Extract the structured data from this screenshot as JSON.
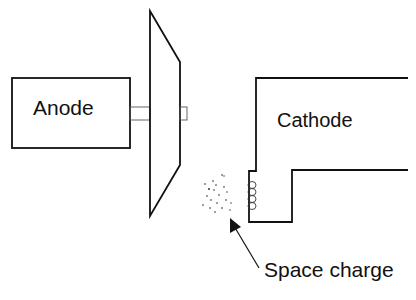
{
  "diagram": {
    "labels": {
      "anode": "Anode",
      "cathode": "Cathode",
      "space_charge": "Space charge"
    },
    "components": [
      "anode-block",
      "anode-stem",
      "focusing-disk",
      "disk-stub",
      "cathode-block",
      "filament-coil",
      "space-charge-cloud",
      "pointer-arrow"
    ],
    "colors": {
      "stroke": "#111111",
      "background": "#ffffff"
    }
  }
}
